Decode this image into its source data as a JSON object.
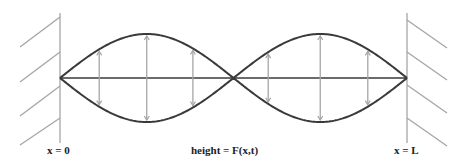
{
  "diagram": {
    "type": "standing-wave",
    "labels": {
      "left_boundary": "x = 0",
      "right_boundary": "x = L",
      "height": "height = F(x,t)"
    },
    "colors": {
      "wave": "#3a3a3a",
      "axis": "#3a3a3a",
      "wall": "#a6a6a6",
      "arrow": "#a6a6a6"
    },
    "loops": 2
  }
}
